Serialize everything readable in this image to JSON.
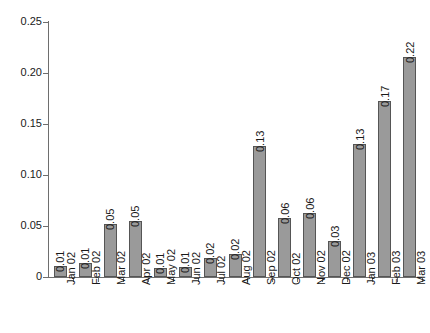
{
  "chart_data": {
    "type": "bar",
    "title": "",
    "xlabel": "",
    "ylabel": "",
    "ylim": [
      0,
      0.25
    ],
    "yticks": [
      "0",
      "0.05",
      "0.10",
      "0.15",
      "0.20",
      "0.25"
    ],
    "ytick_values": [
      0,
      0.05,
      0.1,
      0.15,
      0.2,
      0.25
    ],
    "grid": false,
    "legend": null,
    "categories": [
      "Jan 02",
      "Feb 02",
      "Mar 02",
      "Apr 02",
      "May 02",
      "Jun 02",
      "Jul 02",
      "Aug 02",
      "Sep 02",
      "Oct 02",
      "Nov 02",
      "Dec 02",
      "Jan 03",
      "Feb 03",
      "Mar 03"
    ],
    "values": [
      0.011,
      0.014,
      0.052,
      0.055,
      0.009,
      0.01,
      0.019,
      0.023,
      0.128,
      0.058,
      0.063,
      0.035,
      0.13,
      0.173,
      0.216
    ],
    "data_labels": [
      "0.01",
      "0.01",
      "0.05",
      "0.05",
      "0.01",
      "0.01",
      "0.02",
      "0.02",
      "0.13",
      "0.06",
      "0.06",
      "0.03",
      "0.13",
      "0.17",
      "0.22"
    ],
    "colors": {
      "bar_fill": "#9a9a9a",
      "bar_border": "#555555",
      "axis": "#6e6e6e",
      "text": "#1a1a1a",
      "background": "#ffffff"
    }
  }
}
